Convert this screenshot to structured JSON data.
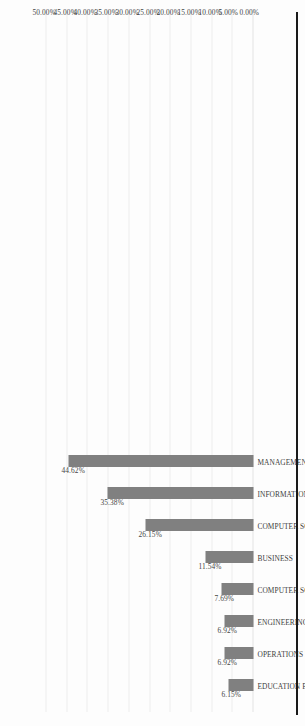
{
  "figure": {
    "background_color": "#fdfdfd",
    "bar_color": "#808080",
    "gridline_color": "#ededed",
    "page_rule_color": "#1a1a1a",
    "text_color": "#3d3d3d",
    "rotation": "90-degrees-counterclockwise"
  },
  "chart_data": {
    "type": "bar",
    "title": "",
    "xlabel": "",
    "ylabel": "",
    "ylim": [
      0,
      50
    ],
    "grid": true,
    "legend": "none",
    "orientation": "vertical-bars-rotated-90ccw",
    "categories": [
      "EDUCATION EDUCATIONAL RESEARCH",
      "OPERATIONS RESEARCH MANAGEMENT SCIENCE",
      "ENGINEERING INDUSTRIAL",
      "COMPUTER SCIENCE INTERDISCIPLINARY APPLICATIONS",
      "BUSINESS",
      "COMPUTER SCIENCE INFORMATION SYSTEMS",
      "INFORMATION SCIENCE LIBRARY SCIENCE",
      "MANAGEMENT"
    ],
    "values": [
      6.15,
      6.92,
      6.92,
      7.69,
      11.54,
      26.15,
      35.38,
      44.62
    ],
    "data_labels": [
      "6.15%",
      "6.92%",
      "6.92%",
      "7.69%",
      "11.54%",
      "26.15%",
      "35.38%",
      "44.62%"
    ],
    "tick_labels": [
      "0.00%",
      "5.00%",
      "10.00%",
      "15.00%",
      "20.00%",
      "25.00%",
      "30.00%",
      "35.00%",
      "40.00%",
      "45.00%",
      "50.00%"
    ],
    "tick_values": [
      0,
      5,
      10,
      15,
      20,
      25,
      30,
      35,
      40,
      45,
      50
    ]
  }
}
